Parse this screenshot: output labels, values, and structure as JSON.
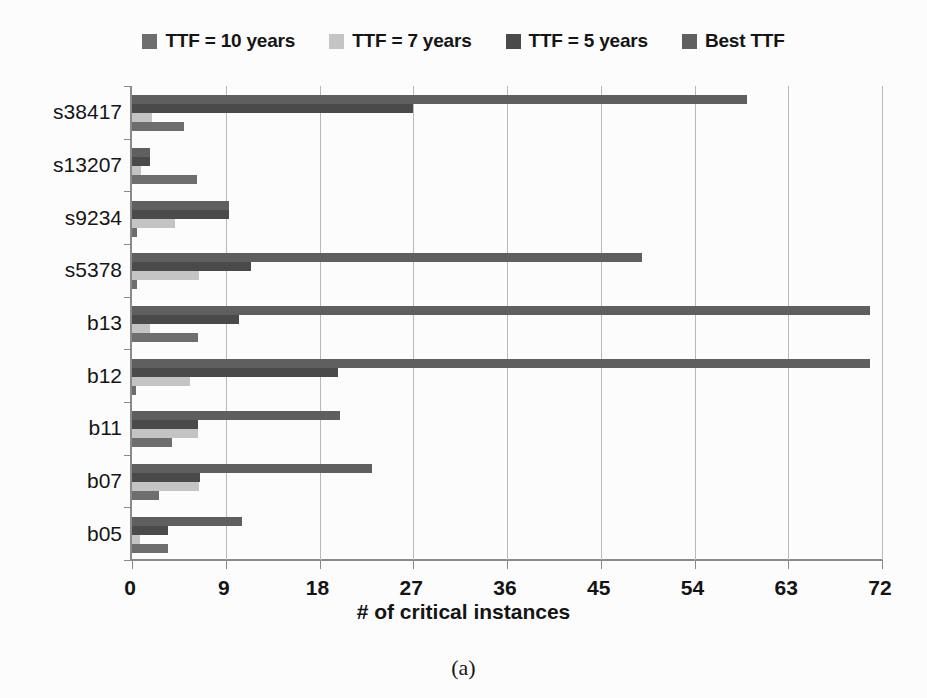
{
  "chart_data": {
    "type": "bar",
    "orientation": "horizontal",
    "title": "",
    "xlabel": "# of critical instances",
    "ylabel": "",
    "xlim": [
      0,
      72
    ],
    "xticks": [
      0,
      9,
      18,
      27,
      36,
      45,
      54,
      63,
      72
    ],
    "grid": true,
    "legend_position": "top",
    "categories": [
      "s38417",
      "s13207",
      "s9234",
      "s5378",
      "b13",
      "b12",
      "b11",
      "b07",
      "b05"
    ],
    "series": [
      {
        "name": "TTF = 10 years",
        "color": "#6e6e6e",
        "values": [
          5.0,
          6.2,
          0.5,
          0.5,
          6.3,
          0.4,
          3.8,
          2.6,
          3.5
        ]
      },
      {
        "name": "TTF = 7 years",
        "color": "#c4c4c4",
        "values": [
          1.9,
          0.9,
          4.1,
          6.4,
          1.7,
          5.6,
          6.3,
          6.4,
          0.8
        ]
      },
      {
        "name": "TTF = 5 years",
        "color": "#4a4a4a",
        "values": [
          27.0,
          1.7,
          9.3,
          11.4,
          10.3,
          19.8,
          6.3,
          6.5,
          3.5
        ]
      },
      {
        "name": "Best TTF",
        "color": "#5f5f5f",
        "values": [
          59.0,
          1.7,
          9.3,
          49.0,
          70.8,
          70.8,
          20.0,
          23.0,
          10.6
        ]
      }
    ]
  },
  "legend": {
    "items": [
      {
        "label": "TTF = 10 years",
        "color": "#6e6e6e"
      },
      {
        "label": "TTF = 7 years",
        "color": "#c4c4c4"
      },
      {
        "label": "TTF = 5 years",
        "color": "#4a4a4a"
      },
      {
        "label": "Best TTF",
        "color": "#5f5f5f"
      }
    ]
  },
  "axis": {
    "x_title": "# of critical instances",
    "x_ticks": [
      "0",
      "9",
      "18",
      "27",
      "36",
      "45",
      "54",
      "63",
      "72"
    ],
    "y_ticks": [
      "s38417",
      "s13207",
      "s9234",
      "s5378",
      "b13",
      "b12",
      "b11",
      "b07",
      "b05"
    ]
  },
  "caption": {
    "text": "(a)"
  }
}
